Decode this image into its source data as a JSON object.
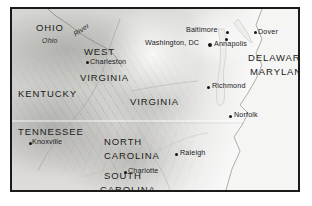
{
  "figure": {
    "kind": "relief-map",
    "region": "Mid-Atlantic and Southeastern United States",
    "style": "grayscale shaded relief",
    "frame_color": "#1a1a1a",
    "land_color": "#d4d3d0",
    "water_color": "#f4f4f3",
    "label_color": "#1b1b1b"
  },
  "states": [
    {
      "name": "OHIO",
      "x": 24,
      "y": 14
    },
    {
      "name": "WEST",
      "x": 72,
      "y": 38
    },
    {
      "name": "VIRGINIA",
      "x": 68,
      "y": 64
    },
    {
      "name": "KENTUCKY",
      "x": 6,
      "y": 80
    },
    {
      "name": "VIRGINIA",
      "x": 118,
      "y": 88
    },
    {
      "name": "DELAWARE",
      "x": 236,
      "y": 44
    },
    {
      "name": "MARYLAND",
      "x": 238,
      "y": 58
    },
    {
      "name": "TENNESSEE",
      "x": 6,
      "y": 118
    },
    {
      "name": "NORTH",
      "x": 92,
      "y": 128
    },
    {
      "name": "CAROLINA",
      "x": 92,
      "y": 142
    },
    {
      "name": "SOUTH",
      "x": 92,
      "y": 162
    },
    {
      "name": "CAROLINA",
      "x": 88,
      "y": 176
    }
  ],
  "cities": [
    {
      "name": "Charleston",
      "label_x": 78,
      "label_y": 51,
      "dot_x": 74,
      "dot_y": 52,
      "marker": "small"
    },
    {
      "name": "Baltimore",
      "label_x": 174,
      "label_y": 18,
      "dot_x": 214,
      "dot_y": 22,
      "marker": "small"
    },
    {
      "name": "Dover",
      "label_x": 246,
      "label_y": 21,
      "dot_x": 242,
      "dot_y": 22,
      "marker": "small"
    },
    {
      "name": "Washington, DC",
      "label_x": 133,
      "label_y": 31,
      "dot_x": 196,
      "dot_y": 34,
      "marker": "big"
    },
    {
      "name": "Annapolis",
      "label_x": 203,
      "label_y": 33,
      "dot_x": 213,
      "dot_y": 29,
      "marker": "small"
    },
    {
      "name": "Richmond",
      "label_x": 200,
      "label_y": 75,
      "dot_x": 195,
      "dot_y": 77,
      "marker": "small"
    },
    {
      "name": "Norfolk",
      "label_x": 222,
      "label_y": 104,
      "dot_x": 217,
      "dot_y": 106,
      "marker": "small"
    },
    {
      "name": "Knoxville",
      "label_x": 20,
      "label_y": 131,
      "dot_x": 17,
      "dot_y": 133,
      "marker": "small"
    },
    {
      "name": "Raleigh",
      "label_x": 168,
      "label_y": 142,
      "dot_x": 163,
      "dot_y": 144,
      "marker": "small"
    },
    {
      "name": "Charlotte",
      "label_x": 116,
      "label_y": 160,
      "dot_x": 112,
      "dot_y": 162,
      "marker": "small"
    }
  ],
  "water_features": [
    {
      "name": "Ohio",
      "x": 30,
      "y": 28,
      "rotated": false
    },
    {
      "name": "River",
      "x": 62,
      "y": 22,
      "rotated": true
    }
  ]
}
